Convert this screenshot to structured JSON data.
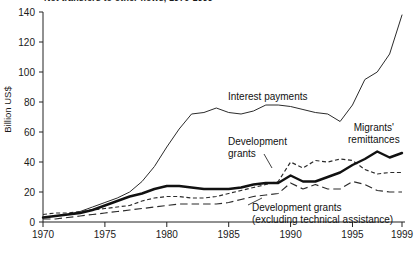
{
  "chart_data": {
    "type": "line",
    "title": "Net transfers to other flows, 1970-1999",
    "xlabel": "",
    "ylabel": "Billion US$",
    "xlim": [
      1970,
      1999
    ],
    "ylim": [
      0,
      140
    ],
    "yticks": [
      0,
      20,
      40,
      60,
      80,
      100,
      120,
      140
    ],
    "xticks": [
      1970,
      1975,
      1980,
      1985,
      1990,
      1995,
      1999
    ],
    "grid": false,
    "legend": "inline-annotations",
    "x": [
      1970,
      1971,
      1972,
      1973,
      1974,
      1975,
      1976,
      1977,
      1978,
      1979,
      1980,
      1981,
      1982,
      1983,
      1984,
      1985,
      1986,
      1987,
      1988,
      1989,
      1990,
      1991,
      1992,
      1993,
      1994,
      1995,
      1996,
      1997,
      1998,
      1999
    ],
    "series": [
      {
        "name": "Interest payments",
        "style": "thin-solid",
        "values": [
          3,
          4,
          5,
          7,
          10,
          13,
          16,
          20,
          27,
          37,
          50,
          62,
          72,
          73,
          76,
          73,
          72,
          74,
          78,
          78,
          77,
          75,
          73,
          72,
          67,
          78,
          95,
          100,
          112,
          138
        ]
      },
      {
        "name": "Migrants' remittances",
        "style": "thick-solid",
        "values": [
          3,
          4,
          5,
          6,
          8,
          11,
          14,
          17,
          19,
          22,
          24,
          24,
          23,
          22,
          22,
          22,
          23,
          25,
          26,
          26,
          31,
          27,
          27,
          30,
          33,
          38,
          42,
          47,
          43,
          46
        ]
      },
      {
        "name": "Development grants",
        "style": "short-dash",
        "values": [
          5,
          6,
          6,
          7,
          8,
          9,
          10,
          11,
          14,
          16,
          17,
          17,
          16,
          16,
          17,
          19,
          21,
          23,
          25,
          27,
          40,
          36,
          41,
          40,
          42,
          41,
          35,
          32,
          33,
          33
        ]
      },
      {
        "name": "Development grants (excluding technical assistance)",
        "style": "long-dash",
        "values": [
          2,
          2,
          3,
          4,
          5,
          6,
          7,
          8,
          9,
          10,
          11,
          12,
          12,
          12,
          12,
          13,
          15,
          17,
          18,
          19,
          26,
          22,
          25,
          22,
          22,
          27,
          25,
          21,
          20,
          20
        ]
      }
    ],
    "annotations": [
      {
        "id": "interest",
        "text": "Interest payments"
      },
      {
        "id": "grants",
        "line1": "Development",
        "line2": "grants"
      },
      {
        "id": "remit",
        "line1": "Migrants'",
        "line2": "remittances"
      },
      {
        "id": "grantsx",
        "line1": "Development grants",
        "line2": "(excluding technical assistance)"
      }
    ]
  }
}
